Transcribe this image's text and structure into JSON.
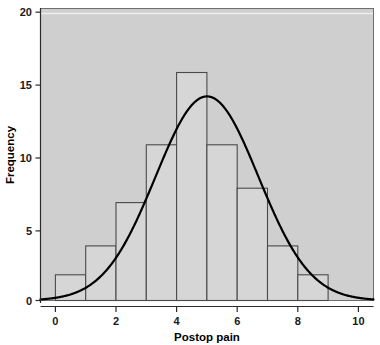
{
  "figure": {
    "width": 380,
    "height": 345,
    "background_color": "#ffffff",
    "panel_color": "#cfcfcf",
    "bar_fill_color": "#d6d6d6",
    "bar_edge_color": "#4a4a4a",
    "curve_color": "#000000"
  },
  "chart_data": {
    "type": "bar",
    "title": "",
    "xlabel": "Postop pain",
    "ylabel": "Frequency",
    "categories": [
      "1",
      "2",
      "3",
      "4",
      "5",
      "6",
      "7",
      "8",
      "9"
    ],
    "x": [
      1,
      2,
      3,
      4,
      5,
      6,
      7,
      8,
      9
    ],
    "values": [
      2,
      4,
      7,
      11,
      16,
      11,
      8,
      4,
      2
    ],
    "bin_edges": [
      0.5,
      1.5,
      2.5,
      3.5,
      4.5,
      5.5,
      6.5,
      7.5,
      8.5,
      9.5
    ],
    "bin_width": 1,
    "xlim": [
      -0.5,
      10.5
    ],
    "ylim": [
      0,
      21
    ],
    "xticks": [
      0,
      2,
      4,
      6,
      8,
      10
    ],
    "xtick_labels": [
      "0",
      "2",
      "4",
      "6",
      "8",
      "10"
    ],
    "yticks": [
      0,
      5,
      10,
      15,
      20
    ],
    "ytick_labels": [
      "0",
      "5",
      "10",
      "15",
      "20"
    ],
    "grid": false,
    "legend": null,
    "overlay": {
      "type": "line",
      "name": "normal-curve",
      "distribution": "normal",
      "mean": 5,
      "std_dev": 1.7,
      "peak_value": 14,
      "n": 65
    }
  }
}
